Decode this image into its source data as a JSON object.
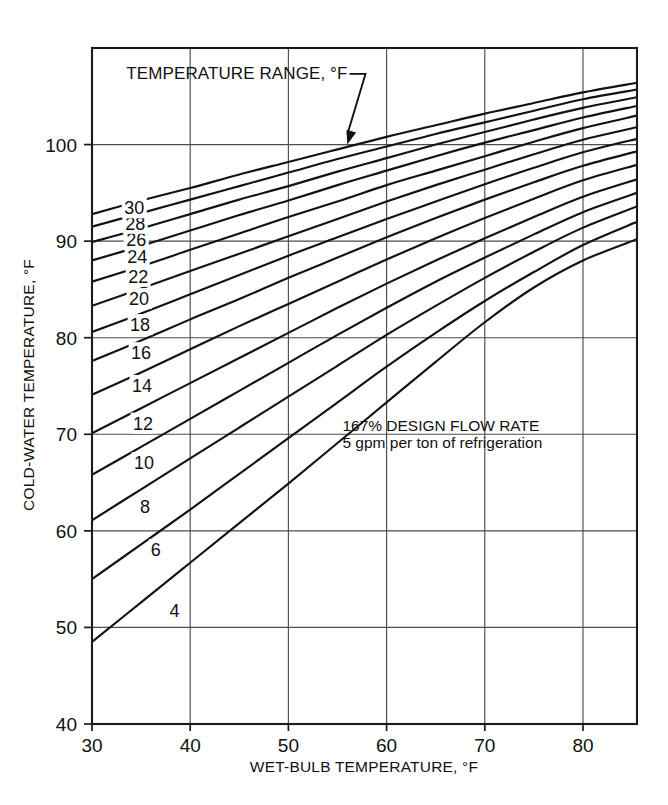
{
  "figure": {
    "title_visible": false,
    "annotation_callout": "TEMPERATURE RANGE, °F",
    "note_line1": "167% DESIGN FLOW RATE",
    "note_line2": "5 gpm per ton of refrigeration",
    "caption_partial": ""
  },
  "axes": {
    "x_title": "WET-BULB TEMPERATURE, °F",
    "y_title": "COLD-WATER TEMPERATURE, °F",
    "x_ticks": [
      "30",
      "40",
      "50",
      "60",
      "70",
      "80"
    ],
    "y_ticks": [
      "40",
      "50",
      "60",
      "70",
      "80",
      "90",
      "100"
    ]
  },
  "chart_data": {
    "type": "line",
    "title": "",
    "subtitle": "",
    "xlabel": "WET-BULB TEMPERATURE, °F",
    "ylabel": "COLD-WATER TEMPERATURE, °F",
    "xlim": [
      30,
      85.5
    ],
    "ylim": [
      40,
      110
    ],
    "xticks": [
      30,
      40,
      50,
      60,
      70,
      80
    ],
    "yticks": [
      40,
      50,
      60,
      70,
      80,
      90,
      100
    ],
    "grid": true,
    "legend": "inline-curve-labels",
    "annotations": [
      {
        "text": "TEMPERATURE RANGE, °F",
        "x": 33.5,
        "y": 106.8,
        "leader_to": {
          "x": 56,
          "y": 100.0
        }
      },
      {
        "text": "167% DESIGN FLOW RATE",
        "x": 55.5,
        "y": 70.3
      },
      {
        "text": "5 gpm per ton of refrigeration",
        "x": 55.5,
        "y": 68.6
      }
    ],
    "series_label_name": "Temperature range, °F",
    "x": [
      30,
      35,
      40,
      45,
      50,
      55,
      60,
      65,
      70,
      75,
      80,
      85.5
    ],
    "series": [
      {
        "name": "4",
        "label": "4",
        "label_x": 38.4,
        "label_y": 51.7,
        "values": [
          48.5,
          52.6,
          56.7,
          60.8,
          64.9,
          69.1,
          73.3,
          77.5,
          81.6,
          85.2,
          88.0,
          90.2
        ]
      },
      {
        "name": "6",
        "label": "6",
        "label_x": 36.5,
        "label_y": 58.0,
        "values": [
          55.0,
          58.6,
          62.2,
          65.9,
          69.6,
          73.3,
          77.0,
          80.5,
          83.8,
          86.8,
          89.6,
          92.0
        ]
      },
      {
        "name": "8",
        "label": "8",
        "label_x": 35.4,
        "label_y": 62.5,
        "values": [
          61.1,
          64.3,
          67.5,
          70.7,
          73.9,
          77.1,
          80.3,
          83.3,
          86.2,
          88.9,
          91.4,
          93.6
        ]
      },
      {
        "name": "10",
        "label": "10",
        "label_x": 35.3,
        "label_y": 67.0,
        "values": [
          65.8,
          68.7,
          71.6,
          74.5,
          77.4,
          80.3,
          83.1,
          85.8,
          88.3,
          90.7,
          93.0,
          95.0
        ]
      },
      {
        "name": "12",
        "label": "12",
        "label_x": 35.2,
        "label_y": 71.1,
        "values": [
          70.1,
          72.7,
          75.3,
          77.9,
          80.5,
          83.1,
          85.6,
          88.0,
          90.3,
          92.5,
          94.6,
          96.4
        ]
      },
      {
        "name": "14",
        "label": "14",
        "label_x": 35.1,
        "label_y": 75.0,
        "values": [
          74.1,
          76.4,
          78.8,
          81.2,
          83.5,
          85.8,
          88.1,
          90.3,
          92.4,
          94.4,
          96.3,
          97.9
        ]
      },
      {
        "name": "16",
        "label": "16",
        "label_x": 35.0,
        "label_y": 78.4,
        "values": [
          77.6,
          79.7,
          81.9,
          84.0,
          86.2,
          88.3,
          90.4,
          92.4,
          94.3,
          96.1,
          97.8,
          99.3
        ]
      },
      {
        "name": "18",
        "label": "18",
        "label_x": 34.9,
        "label_y": 81.3,
        "values": [
          80.6,
          82.5,
          84.5,
          86.5,
          88.5,
          90.4,
          92.3,
          94.1,
          95.9,
          97.6,
          99.2,
          100.6
        ]
      },
      {
        "name": "20",
        "label": "20",
        "label_x": 34.8,
        "label_y": 84.0,
        "values": [
          83.3,
          85.1,
          86.9,
          88.7,
          90.5,
          92.3,
          94.1,
          95.8,
          97.4,
          99.0,
          100.5,
          101.8
        ]
      },
      {
        "name": "22",
        "label": "22",
        "label_x": 34.7,
        "label_y": 86.3,
        "values": [
          85.8,
          87.4,
          89.1,
          90.8,
          92.5,
          94.1,
          95.8,
          97.3,
          98.8,
          100.3,
          101.7,
          103.0
        ]
      },
      {
        "name": "24",
        "label": "24",
        "label_x": 34.6,
        "label_y": 88.4,
        "values": [
          88.0,
          89.5,
          91.1,
          92.7,
          94.2,
          95.8,
          97.3,
          98.8,
          100.2,
          101.5,
          102.8,
          104.0
        ]
      },
      {
        "name": "26",
        "label": "26",
        "label_x": 34.5,
        "label_y": 90.1,
        "values": [
          89.9,
          91.3,
          92.8,
          94.3,
          95.7,
          97.2,
          98.6,
          100.0,
          101.3,
          102.6,
          103.8,
          104.9
        ]
      },
      {
        "name": "28",
        "label": "28",
        "label_x": 34.4,
        "label_y": 91.8,
        "values": [
          91.5,
          92.9,
          94.3,
          95.7,
          97.1,
          98.5,
          99.8,
          101.1,
          102.3,
          103.5,
          104.7,
          105.7
        ]
      },
      {
        "name": "30",
        "label": "30",
        "label_x": 34.3,
        "label_y": 93.4,
        "values": [
          92.8,
          94.2,
          95.5,
          96.9,
          98.2,
          99.5,
          100.8,
          102.0,
          103.2,
          104.3,
          105.4,
          106.4
        ]
      }
    ]
  },
  "colors": {
    "curve": "#131313",
    "grid": "#4d4d4d",
    "axis": "#1b1b1b",
    "background": "#ffffff"
  }
}
